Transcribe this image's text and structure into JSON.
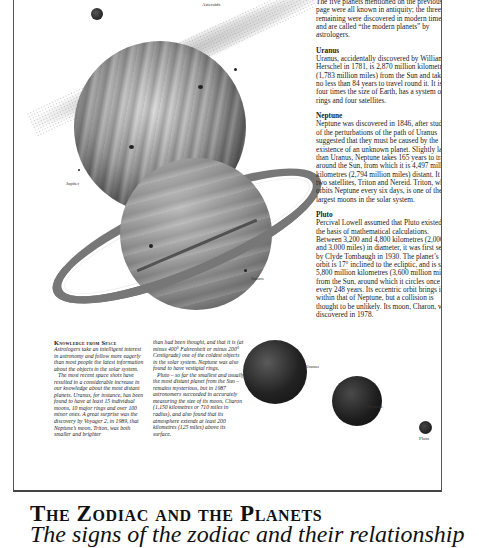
{
  "illustration": {
    "labels": {
      "asteroids": "Asteroids",
      "jupiter": "Jupiter",
      "saturn": "Saturn",
      "uranus": "Uranus",
      "neptune": "Neptune",
      "pluto": "Pluto"
    }
  },
  "main_text": {
    "intro": "The five planets mentioned on the previous page were all known in antiquity; the three remaining were discovered in modern times, and are called “the modern planets” by astrologers.",
    "sections": [
      {
        "heading": "Uranus",
        "body": "Uranus, accidentally discovered by William Herschel in 1781, is 2,870 million kilometres (1,783 million miles) from the Sun and takes no less than 84 years to travel round it. It is four times the size of Earth, has a system of rings and four satellites."
      },
      {
        "heading": "Neptune",
        "body": "Neptune was discovered in 1846, after studies of the perturbations of the path of Uranus suggested that they must be caused by the existence of an unknown planet. Slightly larger than Uranus, Neptune takes 165 years to travel around the Sun, from which it is 4,497 million kilometres (2,794 million miles) distant. It has two satellites, Triton and Nereid. Triton, which orbits Neptune every six days, is one of the largest moons in the solar system."
      },
      {
        "heading": "Pluto",
        "body": "Percival Lowell assumed that Pluto existed, on the basis of mathematical calculations. Between 3,200 and 4,800 kilometres (2,000 and 3,000 miles) in diameter, it was first seen by Clyde Tombaugh in 1930. The planet’s orbit is 17° inclined to the ecliptic, and is some 5,800 million kilometres (3,600 million miles) from the Sun, around which it circles once every 248 years. Its eccentric orbit brings it within that of Neptune, but a collision is thought to be unlikely. Its moon, Charon, was discovered in 1978."
      }
    ]
  },
  "sidebar": {
    "heading": "Knowledge from Space",
    "left_paragraphs": [
      "Astrologers take an intelligent interest in astronomy and follow more eagerly than most people the latest information about the objects in the solar system.",
      "The most recent space shots have resulted in a considerable increase in our knowledge about the most distant planets. Uranus, for instance, has been found to have at least 15 individual moons, 10 major rings and over 100 minor ones. A great surprise was the discovery by Voyager 2, in 1989, that Neptune’s moon, Triton, was both smaller and brighter"
    ],
    "right_paragraphs": [
      "than had been thought, and that it is (at minus 400° Fahrenheit or minus 200° Centigrade) one of the coldest objects in the solar system. Neptune was also found to have vestigial rings.",
      "Pluto – so far the smallest and usually the most distant planet from the Sun – remains mysterious, but in 1987 astronomers succeeded in accurately measuring the size of its moon, Charon (1,150 kilometres or 710 miles in radius), and also found that its atmosphere extends at least 200 kilometres (125 miles) above its surface."
    ]
  },
  "chapter": {
    "title": "The Zodiac and the Planets",
    "subtitle": "The signs of the zodiac and their relationship"
  }
}
